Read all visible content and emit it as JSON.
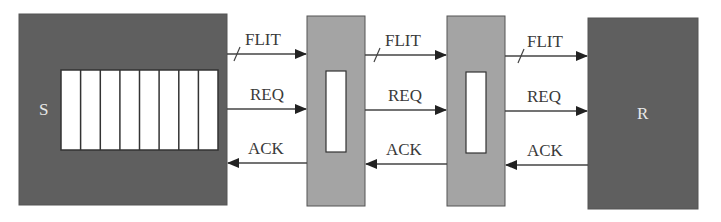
{
  "diagram": {
    "sender": {
      "label": "S",
      "fill": "#5f5f5f",
      "buffer_slots": 8
    },
    "receiver": {
      "label": "R",
      "fill": "#5f5f5f"
    },
    "pipeline_stages": [
      {
        "fill": "#a4a4a4"
      },
      {
        "fill": "#a4a4a4"
      }
    ],
    "signals": {
      "flit": "FLIT",
      "req": "REQ",
      "ack": "ACK"
    },
    "links": [
      {
        "flit": "FLIT",
        "req": "REQ",
        "ack": "ACK"
      },
      {
        "flit": "FLIT",
        "req": "REQ",
        "ack": "ACK"
      },
      {
        "flit": "FLIT",
        "req": "REQ",
        "ack": "ACK"
      }
    ]
  }
}
